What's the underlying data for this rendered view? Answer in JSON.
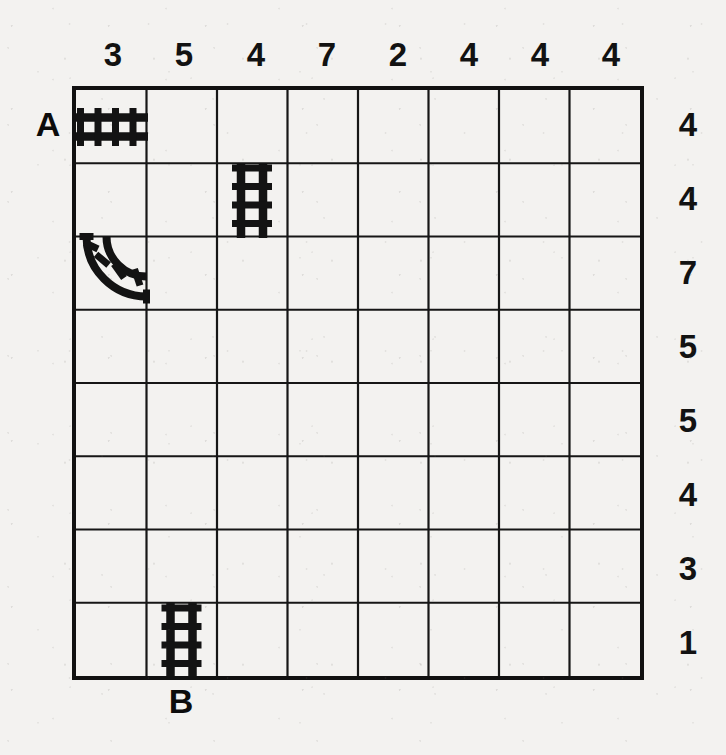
{
  "puzzle": {
    "title": "Railroad Track Grid Puzzle",
    "grid": {
      "columns": 8,
      "rows": 8
    },
    "column_clues": [
      "3",
      "5",
      "4",
      "7",
      "2",
      "4",
      "4",
      "4"
    ],
    "row_clues": [
      "4",
      "4",
      "7",
      "5",
      "5",
      "4",
      "3",
      "1"
    ],
    "endpoints": [
      {
        "label": "A",
        "side": "left",
        "index": 1
      },
      {
        "label": "B",
        "side": "bottom",
        "index": 2
      }
    ],
    "pieces": [
      {
        "name": "track-straight-horizontal",
        "type": "straight",
        "orientation": "horizontal",
        "row": 1,
        "col": 1
      },
      {
        "name": "track-straight-vertical",
        "type": "straight",
        "orientation": "vertical",
        "row": 2,
        "col": 3
      },
      {
        "name": "track-curve",
        "type": "curve",
        "orientation": "top-right",
        "row": 3,
        "col": 1
      },
      {
        "name": "track-straight-vertical",
        "type": "straight",
        "orientation": "vertical",
        "row": 8,
        "col": 2
      }
    ],
    "colors": {
      "background": "#f3f2f0",
      "ink": "#121212",
      "grid_line": "#161616",
      "border": "#111111"
    }
  }
}
